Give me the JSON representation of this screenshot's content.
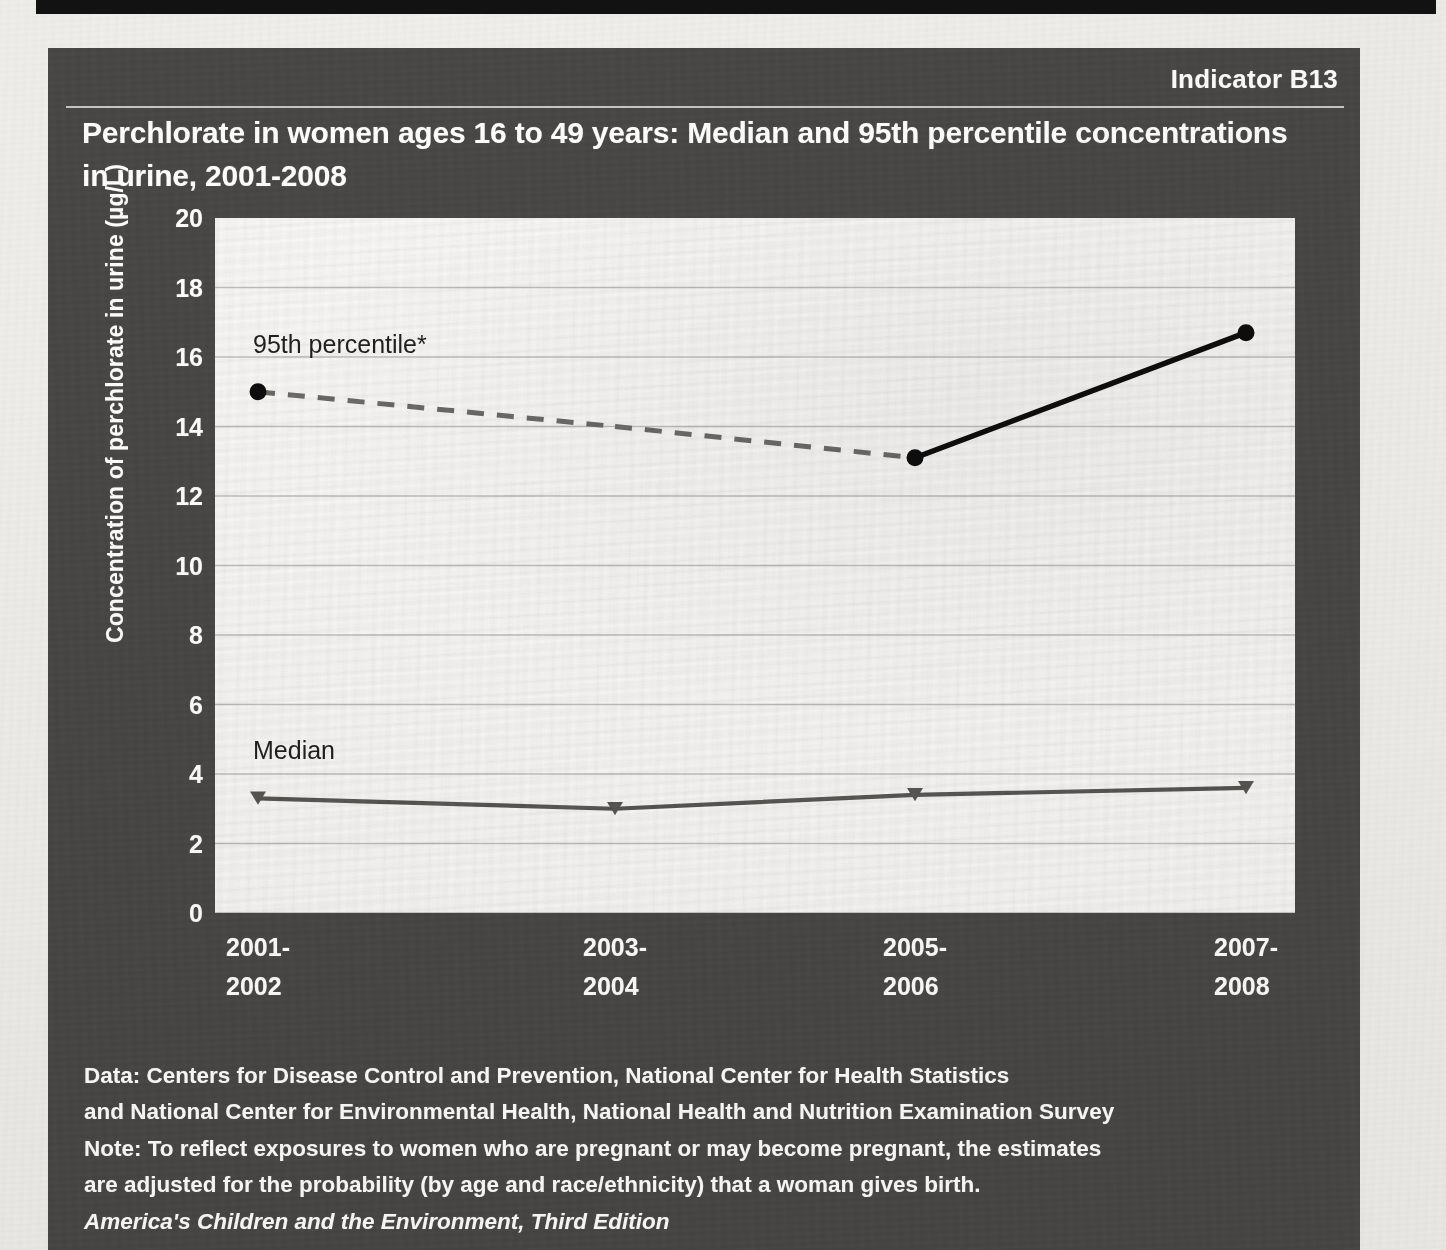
{
  "panel": {
    "indicator": "Indicator B13",
    "title": "Perchlorate in women ages 16 to 49 years: Median and 95th percentile concentrations in urine, 2001-2008"
  },
  "annotations": {
    "series_95_label": "95th percentile*",
    "series_median_label": "Median"
  },
  "footnote": {
    "line1": "Data: Centers for Disease Control and Prevention, National Center for Health Statistics",
    "line2": "and National Center for Environmental Health, National Health and Nutrition Examination Survey",
    "line3": "Note: To reflect exposures to women who are pregnant or may become pregnant, the estimates",
    "line4": "are adjusted for the probability (by age and race/ethnicity) that a woman gives birth.",
    "source": "America's Children and the Environment, Third Edition"
  },
  "colors": {
    "panel_bg": "#494846",
    "plot_bg": "#fbfaf8",
    "gridline": "#b9b7b2",
    "series_95_dashed": "#6e6c68",
    "series_95_solid": "#0d0d0d",
    "series_median": "#5a5853",
    "text_light": "#ffffff",
    "text_dark": "#1f1f1f"
  },
  "chart_data": {
    "type": "line",
    "title": "Perchlorate in women ages 16 to 49 years: Median and 95th percentile concentrations in urine, 2001-2008",
    "xlabel": "",
    "ylabel": "Concentration of perchlorate in urine (µg/L)",
    "categories": [
      "2001-\n2002",
      "2003-\n2004",
      "2005-\n2006",
      "2007-\n2008"
    ],
    "category_labels_line1": [
      "2001-",
      "2003-",
      "2005-",
      "2007-"
    ],
    "category_labels_line2": [
      "2002",
      "2004",
      "2006",
      "2008"
    ],
    "ylim": [
      0,
      20
    ],
    "yticks": [
      0,
      2,
      4,
      6,
      8,
      10,
      12,
      14,
      16,
      18,
      20
    ],
    "ytick_labels": [
      "0",
      "2",
      "4",
      "6",
      "8",
      "10",
      "12",
      "14",
      "16",
      "18",
      "20"
    ],
    "grid": true,
    "grid_axis": "y",
    "legend": "inline-annotation",
    "series": [
      {
        "name": "95th percentile*",
        "values": [
          15.0,
          14.0,
          13.1,
          16.7
        ],
        "marker": "circle",
        "style_per_segment": [
          "dashed",
          "dashed",
          "solid"
        ],
        "color_dashed": "#6e6c68",
        "color_solid": "#0d0d0d"
      },
      {
        "name": "Median",
        "values": [
          3.3,
          3.0,
          3.4,
          3.6
        ],
        "marker": "triangle",
        "style_per_segment": [
          "solid",
          "solid",
          "solid"
        ],
        "color": "#5a5853"
      }
    ]
  }
}
